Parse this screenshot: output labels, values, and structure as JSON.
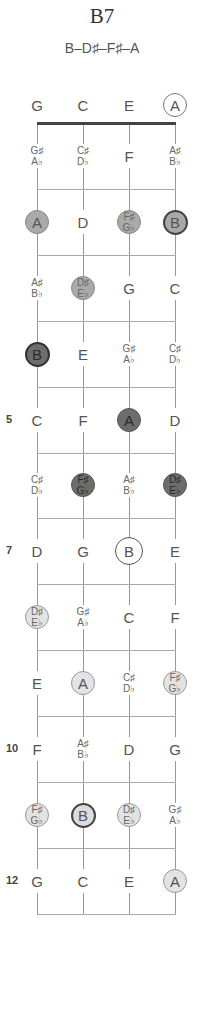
{
  "header": {
    "title": "B7",
    "formula": "B–D♯–F♯–A"
  },
  "strings": [
    "G",
    "C",
    "E",
    "A"
  ],
  "fret_numbers": [
    {
      "fret": 5,
      "label": "5"
    },
    {
      "fret": 7,
      "label": "7"
    },
    {
      "fret": 10,
      "label": "10"
    },
    {
      "fret": 12,
      "label": "12"
    }
  ],
  "rows": [
    {
      "fret": 0,
      "cells": [
        {
          "notes": [
            "G"
          ],
          "style": "plain"
        },
        {
          "notes": [
            "C"
          ],
          "style": "plain"
        },
        {
          "notes": [
            "E"
          ],
          "style": "plain"
        },
        {
          "notes": [
            "A"
          ],
          "style": "open-ring"
        }
      ]
    },
    {
      "fret": 1,
      "cells": [
        {
          "notes": [
            "G♯",
            "A♭"
          ],
          "style": "plain"
        },
        {
          "notes": [
            "C♯",
            "D♭"
          ],
          "style": "plain"
        },
        {
          "notes": [
            "F"
          ],
          "style": "plain"
        },
        {
          "notes": [
            "A♯",
            "B♭"
          ],
          "style": "plain"
        }
      ]
    },
    {
      "fret": 2,
      "cells": [
        {
          "notes": [
            "A"
          ],
          "style": "medium"
        },
        {
          "notes": [
            "D"
          ],
          "style": "plain"
        },
        {
          "notes": [
            "F♯",
            "G♭"
          ],
          "style": "medium"
        },
        {
          "notes": [
            "B"
          ],
          "style": "medium-root"
        }
      ]
    },
    {
      "fret": 3,
      "cells": [
        {
          "notes": [
            "A♯",
            "B♭"
          ],
          "style": "plain"
        },
        {
          "notes": [
            "D♯",
            "E♭"
          ],
          "style": "medium"
        },
        {
          "notes": [
            "G"
          ],
          "style": "plain"
        },
        {
          "notes": [
            "C"
          ],
          "style": "plain"
        }
      ]
    },
    {
      "fret": 4,
      "cells": [
        {
          "notes": [
            "B"
          ],
          "style": "dark-root"
        },
        {
          "notes": [
            "E"
          ],
          "style": "plain"
        },
        {
          "notes": [
            "G♯",
            "A♭"
          ],
          "style": "plain"
        },
        {
          "notes": [
            "C♯",
            "D♭"
          ],
          "style": "plain"
        }
      ]
    },
    {
      "fret": 5,
      "cells": [
        {
          "notes": [
            "C"
          ],
          "style": "plain"
        },
        {
          "notes": [
            "F"
          ],
          "style": "plain"
        },
        {
          "notes": [
            "A"
          ],
          "style": "dark"
        },
        {
          "notes": [
            "D"
          ],
          "style": "plain"
        }
      ]
    },
    {
      "fret": 6,
      "cells": [
        {
          "notes": [
            "C♯",
            "D♭"
          ],
          "style": "plain"
        },
        {
          "notes": [
            "F♯",
            "G♭"
          ],
          "style": "dark"
        },
        {
          "notes": [
            "A♯",
            "B♭"
          ],
          "style": "plain"
        },
        {
          "notes": [
            "D♯",
            "E♭"
          ],
          "style": "dark"
        }
      ]
    },
    {
      "fret": 7,
      "cells": [
        {
          "notes": [
            "D"
          ],
          "style": "plain"
        },
        {
          "notes": [
            "G"
          ],
          "style": "plain"
        },
        {
          "notes": [
            "B"
          ],
          "style": "ring"
        },
        {
          "notes": [
            "E"
          ],
          "style": "plain"
        }
      ]
    },
    {
      "fret": 8,
      "cells": [
        {
          "notes": [
            "D♯",
            "E♭"
          ],
          "style": "light"
        },
        {
          "notes": [
            "G♯",
            "A♭"
          ],
          "style": "plain"
        },
        {
          "notes": [
            "C"
          ],
          "style": "plain"
        },
        {
          "notes": [
            "F"
          ],
          "style": "plain"
        }
      ]
    },
    {
      "fret": 9,
      "cells": [
        {
          "notes": [
            "E"
          ],
          "style": "plain"
        },
        {
          "notes": [
            "A"
          ],
          "style": "light"
        },
        {
          "notes": [
            "C♯",
            "D♭"
          ],
          "style": "plain"
        },
        {
          "notes": [
            "F♯",
            "G♭"
          ],
          "style": "light"
        }
      ]
    },
    {
      "fret": 10,
      "cells": [
        {
          "notes": [
            "F"
          ],
          "style": "plain"
        },
        {
          "notes": [
            "A♯",
            "B♭"
          ],
          "style": "plain"
        },
        {
          "notes": [
            "D"
          ],
          "style": "plain"
        },
        {
          "notes": [
            "G"
          ],
          "style": "plain"
        }
      ]
    },
    {
      "fret": 11,
      "cells": [
        {
          "notes": [
            "F♯",
            "G♭"
          ],
          "style": "light"
        },
        {
          "notes": [
            "B"
          ],
          "style": "light-root"
        },
        {
          "notes": [
            "D♯",
            "E♭"
          ],
          "style": "light"
        },
        {
          "notes": [
            "G♯",
            "A♭"
          ],
          "style": "plain"
        }
      ]
    },
    {
      "fret": 12,
      "cells": [
        {
          "notes": [
            "G"
          ],
          "style": "plain"
        },
        {
          "notes": [
            "C"
          ],
          "style": "plain"
        },
        {
          "notes": [
            "E"
          ],
          "style": "plain"
        },
        {
          "notes": [
            "A"
          ],
          "style": "light"
        }
      ]
    }
  ],
  "colors": {
    "dark": "#6d6d6d",
    "medium": "#aaaaaa",
    "light": "#e3e3e3",
    "nut": "#444444",
    "fret_line": "#aaaaaa"
  }
}
